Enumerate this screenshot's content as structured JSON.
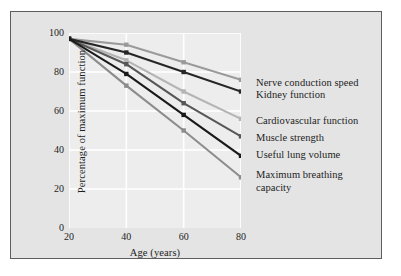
{
  "figure": {
    "kind": "line-chart",
    "background_color": "#e4e4e4",
    "plot_background_color": "#ededed",
    "border_color": "#5d5d5d",
    "gridline_color": "#ffffff",
    "text_color": "#1d1d1d"
  },
  "chart_data": {
    "type": "line",
    "title": "",
    "xlabel": "Age (years)",
    "ylabel": "Percentage of maximum function",
    "x": [
      20,
      40,
      60,
      80
    ],
    "xlim": [
      20,
      80
    ],
    "ylim": [
      0,
      100
    ],
    "xticks": [
      20,
      40,
      60,
      80
    ],
    "yticks": [
      0,
      20,
      40,
      60,
      80,
      100
    ],
    "xtick_labels": [
      "20",
      "40",
      "60",
      "80"
    ],
    "ytick_labels": [
      "0",
      "20",
      "40",
      "60",
      "80",
      "100"
    ],
    "grid": true,
    "grid_color": "#ffffff",
    "legend_position": "right",
    "marker": "square",
    "series": [
      {
        "name": "Nerve conduction speed",
        "values": [
          97,
          94,
          85,
          76
        ],
        "color": "#9a9a9a",
        "label_line1": "Nerve conduction speed",
        "label_line2": ""
      },
      {
        "name": "Kidney function",
        "values": [
          97,
          90,
          80,
          70
        ],
        "color": "#262626",
        "label_line1": "Kidney function",
        "label_line2": ""
      },
      {
        "name": "Cardiovascular function",
        "values": [
          97,
          86,
          70,
          56
        ],
        "color": "#b4b4b4",
        "label_line1": "Cardiovascular function",
        "label_line2": ""
      },
      {
        "name": "Muscle strength",
        "values": [
          97,
          84,
          64,
          47
        ],
        "color": "#575757",
        "label_line1": "Muscle strength",
        "label_line2": ""
      },
      {
        "name": "Useful lung volume",
        "values": [
          97,
          79,
          58,
          37
        ],
        "color": "#1a1a1a",
        "label_line1": "Useful lung volume",
        "label_line2": ""
      },
      {
        "name": "Maximum breathing capacity",
        "values": [
          97,
          73,
          50,
          26
        ],
        "color": "#8c8c8c",
        "label_line1": "Maximum breathing",
        "label_line2": "capacity"
      }
    ]
  },
  "legend": {
    "entries": [
      {
        "text": "Nerve conduction speed"
      },
      {
        "text": "Kidney function"
      },
      {
        "text": "Cardiovascular function"
      },
      {
        "text": "Muscle strength"
      },
      {
        "text": "Useful lung volume"
      },
      {
        "text": "Maximum breathing\ncapacity"
      }
    ]
  }
}
